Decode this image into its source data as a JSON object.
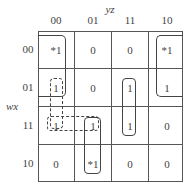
{
  "axes": {
    "col_var": "yz",
    "row_var": "wx",
    "col_labels": [
      "00",
      "01",
      "11",
      "10"
    ],
    "row_labels": [
      "00",
      "01",
      "11",
      "10"
    ]
  },
  "cells": [
    [
      "*1",
      "0",
      "0",
      "*1"
    ],
    [
      " ",
      "0",
      "1",
      "1"
    ],
    [
      " ",
      " ",
      "1",
      "0"
    ],
    [
      "0",
      "*1",
      "0",
      "0"
    ]
  ],
  "cell_notes": {
    "r1c0": "1",
    "r2c0": "1",
    "r2c1": "1"
  },
  "groups": [
    {
      "name": "corner-group-left",
      "cells": [
        "00-00",
        "01-00"
      ],
      "style": "solid"
    },
    {
      "name": "corner-group-right",
      "cells": [
        "00-10",
        "01-10"
      ],
      "style": "solid"
    },
    {
      "name": "column-11-group",
      "cells": [
        "01-11",
        "11-11"
      ],
      "style": "solid"
    },
    {
      "name": "column-01-group",
      "cells": [
        "11-01",
        "10-01"
      ],
      "style": "solid"
    },
    {
      "name": "dashed-vertical-group",
      "cells": [
        "01-00",
        "11-00"
      ],
      "style": "dashed"
    },
    {
      "name": "dashed-horizontal-group",
      "cells": [
        "11-00",
        "11-01"
      ],
      "style": "dashed"
    }
  ]
}
